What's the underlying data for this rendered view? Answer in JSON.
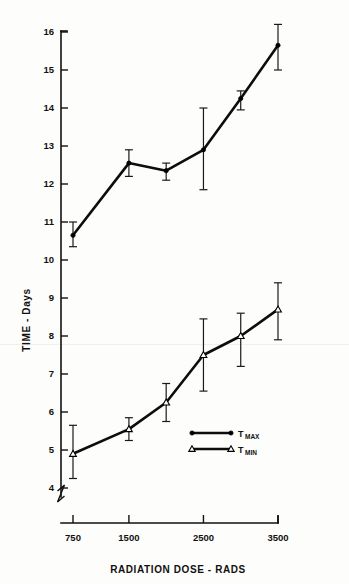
{
  "chart_data": {
    "type": "line",
    "title": "",
    "subtitle": "",
    "xlabel": "RADIATION DOSE - RADS",
    "ylabel": "TIME - Days",
    "x": [
      750,
      1500,
      2000,
      2500,
      3000,
      3500
    ],
    "xtick_values": [
      750,
      1500,
      2500,
      3500
    ],
    "xtick_labels": [
      "750",
      "1500",
      "2500",
      "3500"
    ],
    "ytick_values": [
      4,
      5,
      6,
      7,
      8,
      9,
      10,
      11,
      12,
      13,
      14,
      15,
      16
    ],
    "ytick_labels": [
      "4",
      "5",
      "6",
      "7",
      "8",
      "9",
      "10",
      "11",
      "12",
      "13",
      "14",
      "15",
      "16"
    ],
    "xlim": [
      500,
      3700
    ],
    "ylim": [
      3.4,
      16.3
    ],
    "grid": false,
    "axis_break": true,
    "legend_position": "center-right-lower",
    "series": [
      {
        "name": "T MAX",
        "name_base": "T",
        "name_sub": "MAX",
        "marker": "filled-circle",
        "values": [
          10.65,
          12.55,
          12.35,
          12.9,
          14.25,
          15.65
        ],
        "err_low": [
          10.35,
          12.2,
          12.1,
          11.85,
          13.95,
          15.0
        ],
        "err_high": [
          11.0,
          12.9,
          12.55,
          14.0,
          14.45,
          16.2
        ]
      },
      {
        "name": "T MIN",
        "name_base": "T",
        "name_sub": "MIN",
        "marker": "open-triangle",
        "values": [
          4.9,
          5.55,
          6.25,
          7.5,
          8.0,
          8.7
        ],
        "err_low": [
          4.25,
          5.25,
          5.75,
          6.55,
          7.2,
          7.9
        ],
        "err_high": [
          5.65,
          5.85,
          6.75,
          8.45,
          8.6,
          9.4
        ]
      }
    ],
    "colors": {
      "line": "#0d0d0d",
      "axis": "#111111",
      "background": "#fdfdfc"
    }
  },
  "legend": {
    "entries": [
      {
        "base": "T",
        "sub": "MAX",
        "marker": "filled-circle"
      },
      {
        "base": "T",
        "sub": "MIN",
        "marker": "open-triangle"
      }
    ]
  }
}
